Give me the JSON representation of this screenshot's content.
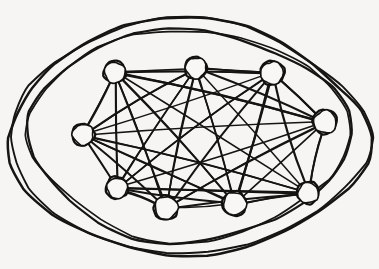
{
  "figure": {
    "medium": "pen-on-paper sketch",
    "background_color": "#f6f5f3",
    "ink_color": "#161412",
    "width": 379,
    "height": 269
  },
  "chart_data": {
    "type": "diagram",
    "subtype": "graph-node-link",
    "graph_name": "K8",
    "node_count": 8,
    "edge_count": 28,
    "is_complete": true,
    "degree_per_node": 7,
    "node_radius": 11,
    "nodes": [
      {
        "id": "n1",
        "label": "top-left",
        "x": 115,
        "y": 72,
        "r": 11
      },
      {
        "id": "n2",
        "label": "top-center",
        "x": 196,
        "y": 68,
        "r": 11
      },
      {
        "id": "n3",
        "label": "top-right",
        "x": 272,
        "y": 73,
        "r": 12
      },
      {
        "id": "n4",
        "label": "right",
        "x": 325,
        "y": 122,
        "r": 12
      },
      {
        "id": "n5",
        "label": "bottom-right",
        "x": 308,
        "y": 193,
        "r": 11
      },
      {
        "id": "n6",
        "label": "bottom-center-right",
        "x": 235,
        "y": 204,
        "r": 12
      },
      {
        "id": "n7",
        "label": "bottom-center-left",
        "x": 166,
        "y": 208,
        "r": 12
      },
      {
        "id": "n8",
        "label": "bottom-left",
        "x": 117,
        "y": 188,
        "r": 11
      },
      {
        "id": "n9",
        "label": "left",
        "x": 83,
        "y": 135,
        "r": 11
      }
    ],
    "edges": [
      [
        "n1",
        "n2"
      ],
      [
        "n1",
        "n3"
      ],
      [
        "n1",
        "n4"
      ],
      [
        "n1",
        "n5"
      ],
      [
        "n1",
        "n6"
      ],
      [
        "n1",
        "n7"
      ],
      [
        "n1",
        "n8"
      ],
      [
        "n1",
        "n9"
      ],
      [
        "n2",
        "n3"
      ],
      [
        "n2",
        "n4"
      ],
      [
        "n2",
        "n5"
      ],
      [
        "n2",
        "n6"
      ],
      [
        "n2",
        "n7"
      ],
      [
        "n2",
        "n8"
      ],
      [
        "n2",
        "n9"
      ],
      [
        "n3",
        "n4"
      ],
      [
        "n3",
        "n5"
      ],
      [
        "n3",
        "n6"
      ],
      [
        "n3",
        "n7"
      ],
      [
        "n3",
        "n8"
      ],
      [
        "n3",
        "n9"
      ],
      [
        "n4",
        "n5"
      ],
      [
        "n4",
        "n6"
      ],
      [
        "n4",
        "n7"
      ],
      [
        "n4",
        "n8"
      ],
      [
        "n4",
        "n9"
      ],
      [
        "n5",
        "n6"
      ],
      [
        "n5",
        "n7"
      ],
      [
        "n5",
        "n8"
      ],
      [
        "n5",
        "n9"
      ],
      [
        "n6",
        "n7"
      ],
      [
        "n6",
        "n8"
      ],
      [
        "n6",
        "n9"
      ],
      [
        "n7",
        "n8"
      ],
      [
        "n7",
        "n9"
      ],
      [
        "n8",
        "n9"
      ]
    ],
    "boundary": {
      "description": "two nested hand-drawn closed blob outlines enclosing the whole graph",
      "stroke_count": 2,
      "outer_extent": {
        "left": 12,
        "top": 24,
        "right": 363,
        "bottom": 250
      },
      "inner_extent": {
        "left": 31,
        "top": 33,
        "right": 346,
        "bottom": 236
      }
    },
    "xlabel": "",
    "ylabel": "",
    "legend": [],
    "annotations": []
  }
}
